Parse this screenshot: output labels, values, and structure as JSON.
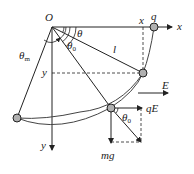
{
  "diagram": {
    "type": "physics-pendulum-in-electric-field",
    "colors": {
      "line": "#222222",
      "ball": "#b0b0b0"
    },
    "labels": {
      "origin": "O",
      "x_axis": "x",
      "y_axis": "y",
      "x_coord": "x",
      "y_coord": "y",
      "charge": "q",
      "length": "l",
      "field": "E",
      "theta": "θ",
      "theta0": "θ",
      "theta0_sub": "0",
      "theta0_force": "θ",
      "theta0_force_sub": "0",
      "theta_m": "θ",
      "theta_m_sub": "m",
      "electric_force": "qE",
      "gravity": "mg"
    }
  }
}
